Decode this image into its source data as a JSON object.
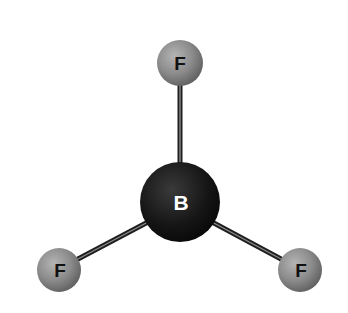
{
  "molecule": {
    "name": "BF3",
    "geometry": "trigonal planar",
    "central_atom": {
      "symbol": "B",
      "cx": 180,
      "cy": 202,
      "r": 40,
      "fill": "#111111",
      "label_color": "#ffffff"
    },
    "outer_atoms": [
      {
        "symbol": "F",
        "cx": 180,
        "cy": 63,
        "r": 23,
        "fill": "#8a8a8a",
        "label_color": "#111111"
      },
      {
        "symbol": "F",
        "cx": 59,
        "cy": 270,
        "r": 22,
        "fill": "#8a8a8a",
        "label_color": "#111111"
      },
      {
        "symbol": "F",
        "cx": 300,
        "cy": 270,
        "r": 22,
        "fill": "#8a8a8a",
        "label_color": "#111111"
      }
    ],
    "bonds": [
      {
        "from": "B",
        "to": "F-top"
      },
      {
        "from": "B",
        "to": "F-left"
      },
      {
        "from": "B",
        "to": "F-right"
      }
    ],
    "bond_color": "#2a2a2a"
  },
  "labels": {
    "central": "B",
    "top": "F",
    "left": "F",
    "right": "F"
  }
}
